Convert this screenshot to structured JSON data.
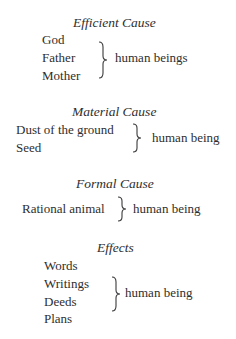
{
  "sections": [
    {
      "heading": "Efficient Cause",
      "items": [
        "God",
        "Father",
        "Mother"
      ],
      "result": "human beings"
    },
    {
      "heading": "Material Cause",
      "items": [
        "Dust of the ground",
        "Seed"
      ],
      "result": "human being"
    },
    {
      "heading": "Formal Cause",
      "items": [
        "Rational animal"
      ],
      "result": "human being"
    },
    {
      "heading": "Effects",
      "items": [
        "Words",
        "Writings",
        "Deeds",
        "Plans"
      ],
      "result": "human being"
    }
  ],
  "colors": {
    "text": "#2e2e2e",
    "background": "#ffffff"
  }
}
